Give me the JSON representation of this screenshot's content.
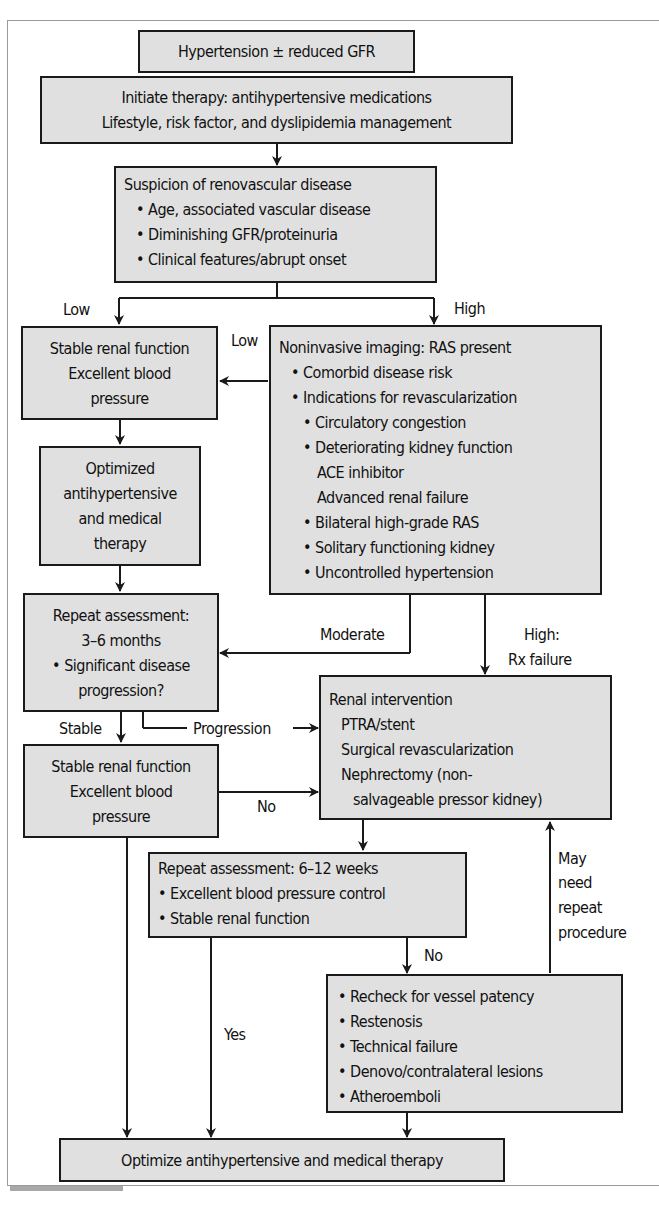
{
  "flowchart": {
    "start": {
      "text": "Hypertension ± reduced GFR"
    },
    "initiate": {
      "lines": [
        "Initiate therapy: antihypertensive medications",
        "Lifestyle, risk factor, and dyslipidemia management"
      ]
    },
    "suspicion": {
      "title": "Suspicion of renovascular disease",
      "bullets": [
        "• Age, associated vascular disease",
        "• Diminishing GFR/proteinuria",
        "• Clinical features/abrupt onset"
      ]
    },
    "stable1": {
      "lines": [
        "Stable renal function",
        "Excellent blood",
        "pressure"
      ]
    },
    "imaging": {
      "title": "Noninvasive imaging: RAS present",
      "items": [
        {
          "text": "• Comorbid disease risk",
          "level": 1
        },
        {
          "text": "• Indications for revascularization",
          "level": 1
        },
        {
          "text": "• Circulatory congestion",
          "level": 2
        },
        {
          "text": "• Deteriorating kidney function",
          "level": 2
        },
        {
          "text": "ACE inhibitor",
          "level": 3
        },
        {
          "text": "Advanced renal failure",
          "level": 3
        },
        {
          "text": "• Bilateral high-grade RAS",
          "level": 2
        },
        {
          "text": "• Solitary functioning kidney",
          "level": 2
        },
        {
          "text": "• Uncontrolled hypertension",
          "level": 2
        }
      ]
    },
    "optimized": {
      "lines": [
        "Optimized",
        "antihypertensive",
        "and medical",
        "therapy"
      ]
    },
    "repeat1": {
      "lines": [
        "Repeat assessment:",
        "3–6 months",
        "• Significant disease",
        "progression?"
      ]
    },
    "renal_intervention": {
      "title": "Renal intervention",
      "items": [
        "PTRA/stent",
        "Surgical revascularization",
        "Nephrectomy (non-",
        "salvageable pressor kidney)"
      ]
    },
    "stable2": {
      "lines": [
        "Stable renal function",
        "Excellent blood",
        "pressure"
      ]
    },
    "repeat2": {
      "title": "Repeat assessment: 6–12 weeks",
      "bullets": [
        "• Excellent blood pressure control",
        "• Stable renal function"
      ]
    },
    "recheck": {
      "bullets": [
        "• Recheck for vessel patency",
        "• Restenosis",
        "• Technical failure",
        "• Denovo/contralateral lesions",
        "• Atheroemboli"
      ]
    },
    "final": {
      "text": "Optimize antihypertensive and medical therapy"
    },
    "labels": {
      "low_left": "Low",
      "high": "High",
      "low_mid": "Low",
      "moderate": "Moderate",
      "high_rx_1": "High:",
      "high_rx_2": "Rx failure",
      "stable": "Stable",
      "progression": "Progression",
      "no_mid": "No",
      "no_right": "No",
      "yes": "Yes",
      "may_need": [
        "May",
        "need",
        "repeat",
        "procedure"
      ]
    }
  },
  "colors": {
    "box_fill": "#e0e0e0",
    "border": "#1a1a1a",
    "frame": "#9a9a9a"
  }
}
